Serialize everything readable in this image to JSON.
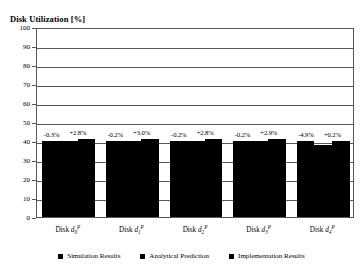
{
  "chart_data": {
    "type": "bar",
    "title": "Disk Utilization [%]",
    "xlabel": "",
    "ylabel": "Disk Utilization [%]",
    "ylim": [
      0,
      100
    ],
    "ytick_step": 10,
    "yticks": [
      "0",
      "10",
      "20",
      "30",
      "40",
      "50",
      "60",
      "70",
      "80",
      "90",
      "100"
    ],
    "grid": true,
    "legend_position": "bottom",
    "categories": [
      "Disk d0P",
      "Disk d1P",
      "Disk d2P",
      "Disk d3P",
      "Disk d4P"
    ],
    "series": [
      {
        "name": "Simulation Results",
        "values": [
          40.0,
          40.0,
          40.0,
          40.0,
          39.9
        ]
      },
      {
        "name": "Analytical Prediction",
        "values": [
          39.9,
          39.9,
          39.9,
          39.9,
          38.0
        ]
      },
      {
        "name": "Implementation Results",
        "values": [
          41.1,
          41.1,
          41.1,
          41.1,
          40.0
        ]
      }
    ],
    "annotations": [
      [
        "-0.3%",
        "+2.8%"
      ],
      [
        "-0.2%",
        "+3.0%"
      ],
      [
        "-0.2%",
        "+2.8%"
      ],
      [
        "-0.2%",
        "+2.9%"
      ],
      [
        "-4.9%",
        "+0.2%"
      ]
    ]
  },
  "axis": {
    "y_labels": [
      "100",
      "90",
      "80",
      "70",
      "60",
      "50",
      "40",
      "30",
      "20",
      "10",
      "0"
    ],
    "x_labels": [
      {
        "prefix": "Disk ",
        "var": "d",
        "sub": "0",
        "sup": "P"
      },
      {
        "prefix": "Disk ",
        "var": "d",
        "sub": "1",
        "sup": "P"
      },
      {
        "prefix": "Disk ",
        "var": "d",
        "sub": "2",
        "sup": "P"
      },
      {
        "prefix": "Disk ",
        "var": "d",
        "sub": "3",
        "sup": "P"
      },
      {
        "prefix": "Disk ",
        "var": "d",
        "sub": "4",
        "sup": "P"
      }
    ]
  },
  "deltas": [
    "-0.3%",
    "+2.8%",
    "-0.2%",
    "+3.0%",
    "-0.2%",
    "+2.8%",
    "-0.2%",
    "+2.9%",
    "-4.9%",
    "+0.2%"
  ],
  "legend": {
    "items": [
      {
        "label": "Simulation Results",
        "color": "#000000"
      },
      {
        "label": "Analytical Prediction",
        "color": "#000000"
      },
      {
        "label": "Implementation Results",
        "color": "#000000"
      }
    ]
  },
  "colors": {
    "bar": "#000000",
    "grid": "#55585a",
    "background": "#ffffff",
    "text": "#000000"
  }
}
